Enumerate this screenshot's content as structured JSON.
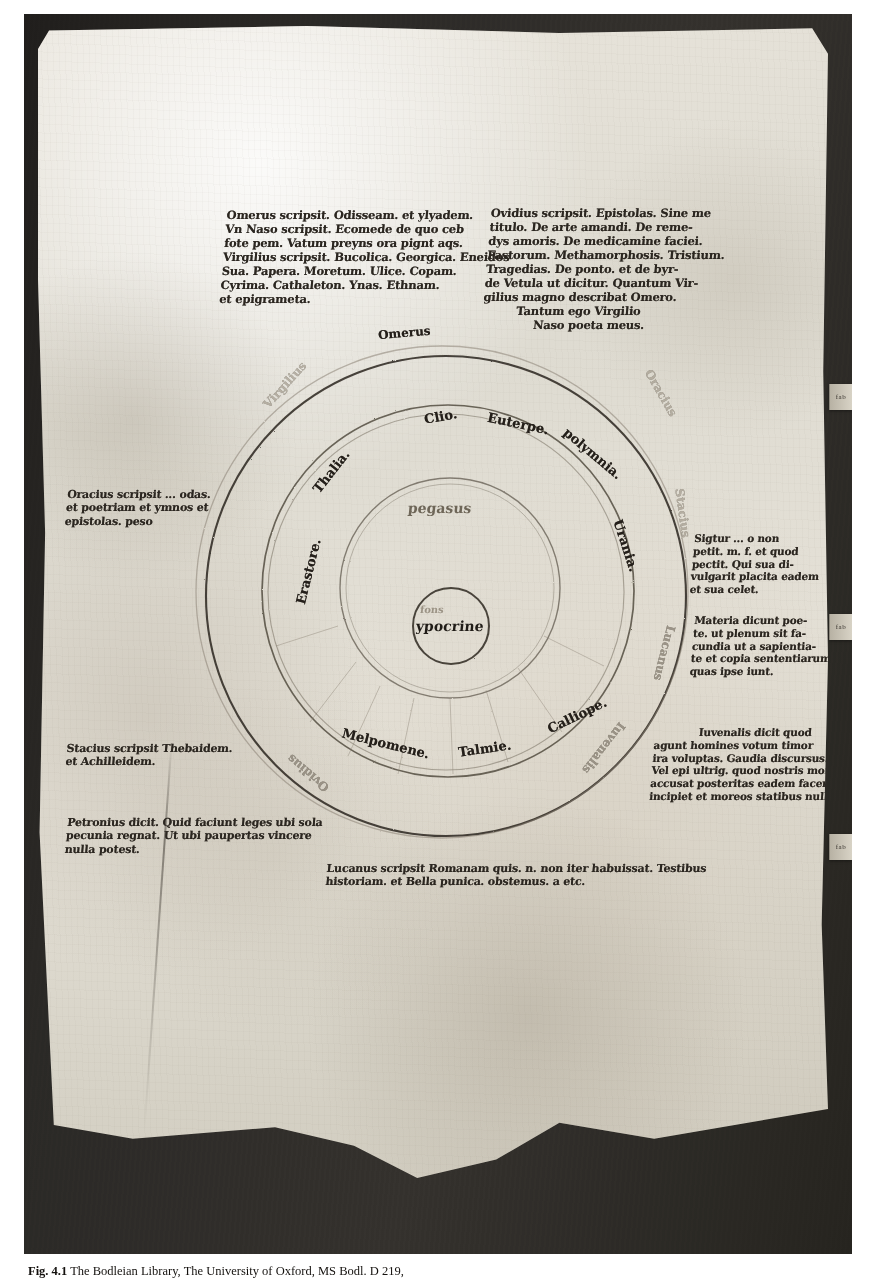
{
  "plate": {
    "caption_label": "Fig. 4.1",
    "caption_text": "The Bodleian Library, The University of Oxford, MS Bodl. D 219,"
  },
  "edge_tabs": [
    {
      "label": "fab"
    },
    {
      "label": "fab"
    },
    {
      "label": "fab"
    }
  ],
  "diagram": {
    "center_label": "ypocrine",
    "center_faint_label": "fons",
    "second_ring_label": "pegasus",
    "muses_ring": [
      {
        "name": "Clio.",
        "angle": -36
      },
      {
        "name": "Euterpe.",
        "angle": -8
      },
      {
        "name": "polymnia.",
        "angle": 22
      },
      {
        "name": "Urania.",
        "angle": 62
      },
      {
        "name": "Calliope.",
        "angle": 112
      },
      {
        "name": "Talmie.",
        "angle": 140
      },
      {
        "name": "Melpomene.",
        "angle": 168
      },
      {
        "name": "Erastore.",
        "angle": 208
      },
      {
        "name": "Thalia.",
        "angle": 238
      }
    ],
    "poets_ring": [
      {
        "name": "Omerus",
        "angle": -90
      },
      {
        "name": "Oracius",
        "angle": -38
      },
      {
        "name": "Stacius",
        "angle": 14
      },
      {
        "name": "Lucanus",
        "angle": 58
      },
      {
        "name": "Iuvenalis",
        "angle": 100
      },
      {
        "name": "Ovidius",
        "angle": 152
      },
      {
        "name": "Virgilius",
        "angle": 232
      }
    ]
  },
  "margins": {
    "top_left": {
      "opening": "Omerus",
      "opening_rest": "scripsit",
      "lines": [
        "Omerus scripsit. Odisseam. et ylyadem.",
        "Vn Naso scripsit. Ecomede de quo ceb",
        "fote pem. Vatum preyns ora pignt aqs.",
        "Virgilius scripsit. Bucolica. Georgica. Eneidos",
        "Sua. Papera. Moretum. Ulice. Copam.",
        "Cyrima. Cathaleton. Ynas. Ethnam.",
        "et epigrameta."
      ]
    },
    "top_right": {
      "opening": "Ovidius",
      "opening_rest": "scripsit",
      "lines": [
        "Ovidius scripsit. Epistolas. Sine me",
        "titulo. De arte amandi. De reme-",
        "dys amoris. De medicamine faciei.",
        "Fastorum. Methamorphosis. Tristium.",
        "Tragedias. De ponto. et de byr-",
        "de Vetula ut dicitur. Quantum Vir-",
        "gilius magno describat Omero.",
        "Tantum ego Virgilio",
        "Naso poeta meus."
      ]
    },
    "left_mid": {
      "opening": "Oracius",
      "opening_rest": "scripsit",
      "lines": [
        "Oracius scripsit ... odas.",
        "et poetriam et ymnos et",
        "epistolas.  peso"
      ]
    },
    "left_lower": {
      "opening": "Stacius",
      "opening_rest": "scripsit",
      "lines": [
        "Stacius scripsit Thebaidem.",
        "et Achilleidem."
      ]
    },
    "left_bottom": {
      "opening": "Petronius",
      "opening_rest": "dicit",
      "lines": [
        "Petronius dicit. Quid faciunt leges ubi sola",
        "pecunia regnat. Ut ubi paupertas vincere",
        "nulla potest."
      ]
    },
    "right_upper": {
      "lines": [
        "Sigtur ... o non",
        "petit. m. f. et quod",
        "pectit. Qui sua di-",
        "vulgarit placita eadem",
        "et sua celet."
      ]
    },
    "right_mid": {
      "lines": [
        "Materia dicunt poe-",
        "te. ut plenum sit fa-",
        "cundia ut a sapientia-",
        "te et copia sententiarum",
        "quas ipse iunt."
      ]
    },
    "right_lower": {
      "opening": "Iuvenalis",
      "opening_rest": "dicit",
      "lines": [
        "Iuvenalis dicit quod",
        "agunt homines votum timor",
        "ira voluptas. Gaudia discursus.",
        "Vel epi ultrig. quod nostris moribus",
        "accusat posteritas eadem facere",
        "incipiet et moreos statibus nulla fides"
      ]
    },
    "bottom_center": {
      "opening": "Lucanus",
      "opening_rest": "scripsit",
      "lines": [
        "Lucanus scripsit Romanam quis. n. non iter habuissat. Testibus",
        "historiam. et Bella punica. obstemus. a etc."
      ]
    }
  }
}
